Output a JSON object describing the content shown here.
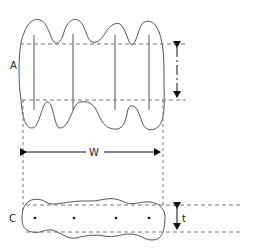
{
  "diagram": {
    "labels": {
      "top_shape": "A",
      "bottom_shape": "C",
      "width": "W",
      "thickness": "t"
    },
    "colors": {
      "outline": "#555555",
      "dashed": "#777777",
      "arrow": "#111111",
      "background": "#ffffff"
    },
    "top_shape": {
      "inner_lines": 4
    },
    "bottom_shape": {
      "dots": 4
    }
  }
}
